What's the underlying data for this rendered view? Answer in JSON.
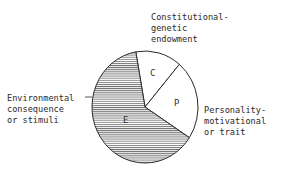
{
  "chart_data": {
    "type": "pie",
    "title": "",
    "slices": [
      {
        "key": "C",
        "label": "Constitutional-genetic endowment",
        "label_lines": [
          "Constitutional-",
          "genetic",
          "endowment"
        ],
        "value": 14,
        "fill": "white"
      },
      {
        "key": "P",
        "label": "Personality-motivational or trait",
        "label_lines": [
          "Personality-",
          "motivational",
          "or trait"
        ],
        "value": 23,
        "fill": "white"
      },
      {
        "key": "E",
        "label": "Environmental consequence or stimuli",
        "label_lines": [
          "Environmental",
          "consequence",
          "or stimuli"
        ],
        "value": 63,
        "fill": "horizontal-hatch"
      }
    ],
    "legend": "none",
    "start_angle_deg": -100
  },
  "colors": {
    "stroke": "#2a2a2a",
    "hatch": "#555555",
    "background": "#ffffff"
  }
}
